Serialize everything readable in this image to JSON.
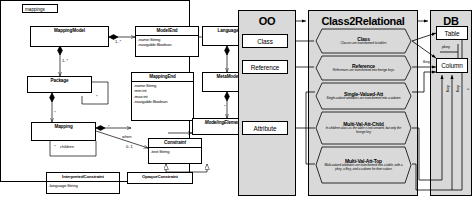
{
  "left_diagram": {
    "name": "mappings-uml-class-diagram",
    "package_label": "mappings",
    "classes": [
      {
        "id": "MappingModel",
        "name": "MappingModel",
        "abstract": false,
        "attrs": []
      },
      {
        "id": "ModelEnd",
        "name": "ModelEnd",
        "abstract": false,
        "attrs": [
          "-name:String",
          "-navigable:Boolean"
        ]
      },
      {
        "id": "Language",
        "name": "Language",
        "abstract": false,
        "attrs": []
      },
      {
        "id": "Package",
        "name": "Package",
        "abstract": false,
        "attrs": []
      },
      {
        "id": "MappingEnd",
        "name": "MappingEnd",
        "abstract": false,
        "attrs": [
          "-name:String",
          "-min:int",
          "-max:int",
          "-navigable:Boolean"
        ]
      },
      {
        "id": "MetaModel",
        "name": "MetaModel",
        "abstract": false,
        "attrs": []
      },
      {
        "id": "Mapping",
        "name": "Mapping",
        "abstract": false,
        "attrs": []
      },
      {
        "id": "Constraint",
        "name": "Constraint",
        "abstract": true,
        "attrs": [
          "-text:String"
        ]
      },
      {
        "id": "ModelingElement",
        "name": "ModelingElement",
        "abstract": true,
        "attrs": []
      },
      {
        "id": "InterpretedConstraint",
        "name": "InterpretedConstraint",
        "abstract": false,
        "attrs": [
          "-language:String"
        ]
      },
      {
        "id": "OpaqueConstraint",
        "name": "OpaqueConstraint",
        "abstract": false,
        "attrs": []
      }
    ],
    "multiplicities": [
      "1..*",
      "1..*",
      "*",
      "*",
      "*",
      "*",
      "*",
      "0..1"
    ],
    "role_labels": [
      "children",
      "when"
    ]
  },
  "right_diagram": {
    "name": "class2relational-transformation-diagram",
    "lanes": [
      {
        "id": "oo",
        "title": "OO"
      },
      {
        "id": "c2r",
        "title": "Class2Relational"
      },
      {
        "id": "db",
        "title": "DB"
      }
    ],
    "oo_elements": [
      {
        "id": "Class",
        "label": "Class"
      },
      {
        "id": "Reference",
        "label": "Reference"
      },
      {
        "id": "Attribute",
        "label": "Attribute"
      }
    ],
    "db_elements": [
      {
        "id": "Table",
        "label": "Table"
      },
      {
        "id": "Column",
        "label": "Column"
      }
    ],
    "db_edge_labels": [
      "pkey",
      "fkey",
      "fkey",
      "fkey",
      "c"
    ],
    "rules": [
      {
        "id": "rule-class",
        "name": "Class",
        "desc": "Classes are transformed to tables"
      },
      {
        "id": "rule-reference",
        "name": "Reference",
        "desc": "References are transformed into foreign keys"
      },
      {
        "id": "rule-single-valued-att",
        "name": "Single-Valued-Att",
        "desc": "Single-valued attributes are transformed into a column"
      },
      {
        "id": "rule-multi-val-att-child",
        "name": "Multi-Val-Att-Child",
        "desc": "In children class as the table is not created, but only the foreign key"
      },
      {
        "id": "rule-multi-val-att-top",
        "name": "Multi-Val-Att-Top",
        "desc": "Multi-valued attributes are transformed into a table, with a pkey, a fkey, and a column for their values"
      }
    ]
  },
  "colors": {
    "line": "#000000",
    "lane_fill": "#d9d9d9",
    "box_fill": "#ffffff",
    "page_bg": "#ffffff"
  }
}
